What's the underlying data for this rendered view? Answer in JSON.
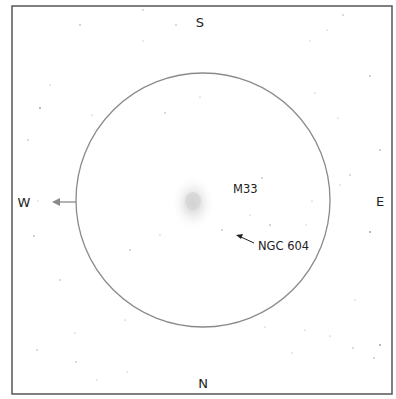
{
  "diagram": {
    "compass": {
      "north": "N",
      "south": "S",
      "east": "E",
      "west": "W"
    },
    "objects": [
      {
        "label": "M33",
        "type": "galaxy"
      },
      {
        "label": "NGC 604",
        "type": "nebula-pointer"
      }
    ],
    "field_circle": {
      "color": "#8a8a8a"
    },
    "motion_arrow": {
      "direction": "W",
      "color": "#8a8a8a"
    },
    "frame_color": "#555555"
  }
}
